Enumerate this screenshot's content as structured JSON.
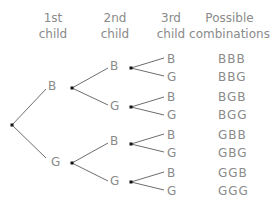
{
  "headers": {
    "col1": [
      "1st",
      "child"
    ],
    "col2": [
      "2nd",
      "child"
    ],
    "col3": [
      "3rd",
      "child"
    ],
    "col4": [
      "Possible",
      "combinations"
    ]
  },
  "tree": {
    "level1": [
      "B",
      "G"
    ],
    "level2": [
      "B",
      "G",
      "B",
      "G"
    ],
    "level3": [
      "B",
      "G",
      "B",
      "G",
      "B",
      "G",
      "B",
      "G"
    ]
  },
  "combinations": [
    "BBB",
    "BBG",
    "BGB",
    "BGG",
    "GBB",
    "GBG",
    "GGB",
    "GGG"
  ],
  "colors": {
    "text": "#8a8a8a",
    "lines": "#6e6e6e",
    "dots": "#111111"
  }
}
